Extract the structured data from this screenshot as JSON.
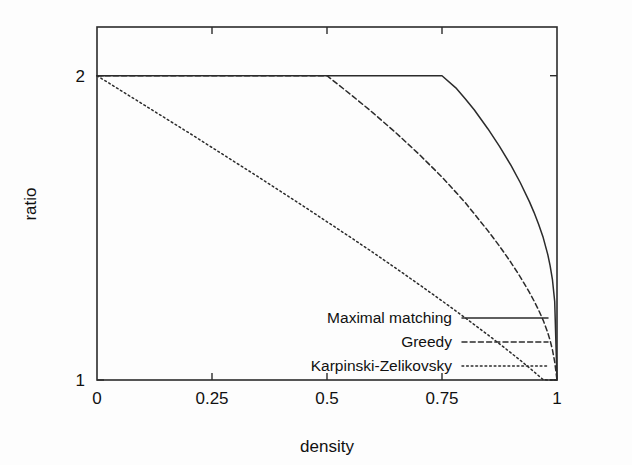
{
  "chart_data": {
    "type": "line",
    "title": "",
    "subtitle": "",
    "xlabel": "density",
    "ylabel": "ratio",
    "xlim": [
      0,
      1
    ],
    "ylim": [
      1,
      2.16
    ],
    "x_ticks": [
      0,
      0.25,
      0.5,
      0.75,
      1
    ],
    "x_tick_labels": [
      "0",
      "0.25",
      "0.5",
      "0.75",
      "1"
    ],
    "y_ticks": [
      1,
      2
    ],
    "y_tick_labels": [
      "1",
      "2"
    ],
    "grid": false,
    "legend_position": "inside bottom-right",
    "frame": "box with inward ticks",
    "series": [
      {
        "name": "Maximal matching",
        "style": "solid",
        "breakpoint_x": 0.75,
        "x": [
          0,
          0.1,
          0.2,
          0.3,
          0.4,
          0.5,
          0.6,
          0.7,
          0.75,
          0.78,
          0.8,
          0.82,
          0.85,
          0.875,
          0.9,
          0.92,
          0.94,
          0.95,
          0.96,
          0.97,
          0.98,
          0.985,
          0.99,
          0.995,
          1
        ],
        "y": [
          2,
          2,
          2,
          2,
          2,
          2,
          2,
          2,
          2,
          1.96,
          1.925,
          1.888,
          1.825,
          1.768,
          1.705,
          1.649,
          1.586,
          1.551,
          1.512,
          1.468,
          1.412,
          1.376,
          1.331,
          1.258,
          1
        ]
      },
      {
        "name": "Greedy",
        "style": "dashed",
        "breakpoint_x": 0.5,
        "x": [
          0,
          0.1,
          0.2,
          0.3,
          0.4,
          0.5,
          0.55,
          0.6,
          0.65,
          0.7,
          0.75,
          0.8,
          0.85,
          0.875,
          0.9,
          0.92,
          0.94,
          0.95,
          0.96,
          0.97,
          0.98,
          0.985,
          0.99,
          0.995,
          1
        ],
        "y": [
          2,
          2,
          2,
          2,
          2,
          2,
          1.94,
          1.878,
          1.812,
          1.742,
          1.667,
          1.584,
          1.49,
          1.44,
          1.386,
          1.339,
          1.288,
          1.26,
          1.23,
          1.196,
          1.155,
          1.13,
          1.1,
          1.06,
          1
        ]
      },
      {
        "name": "Karpinski-Zelikovsky",
        "style": "dotted",
        "breakpoint_x": 0,
        "x": [
          0,
          0.05,
          0.1,
          0.15,
          0.2,
          0.25,
          0.3,
          0.35,
          0.4,
          0.45,
          0.5,
          0.55,
          0.6,
          0.65,
          0.7,
          0.75,
          0.8,
          0.85,
          0.875,
          0.9,
          0.92,
          0.94,
          0.95,
          0.96,
          0.97,
          0.98,
          0.985,
          0.99,
          0.995,
          1
        ],
        "y": [
          2,
          1.953,
          1.906,
          1.859,
          1.812,
          1.764,
          1.716,
          1.668,
          1.619,
          1.57,
          1.52,
          1.47,
          1.419,
          1.367,
          1.314,
          1.26,
          1.205,
          1.148,
          1.119,
          1.089,
          1.065,
          1.04,
          1.027,
          1.014,
          1.001,
          1,
          1,
          1,
          1,
          1
        ]
      }
    ],
    "legend": [
      {
        "label": "Maximal matching",
        "style": "solid"
      },
      {
        "label": "Greedy",
        "style": "dashed"
      },
      {
        "label": "Karpinski-Zelikovsky",
        "style": "dotted"
      }
    ],
    "colors": {
      "background": "#fdfdfd",
      "ink": "#2b2b2b",
      "text": "#111111"
    }
  }
}
